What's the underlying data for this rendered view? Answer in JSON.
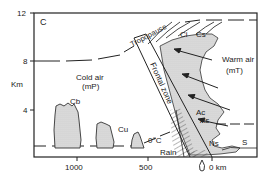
{
  "figure": {
    "panel_label": "C",
    "y_axis": {
      "label": "Km",
      "ticks": [
        "12",
        "8",
        "4"
      ]
    },
    "x_axis": {
      "ticks": [
        "1000",
        "500",
        "0 km"
      ]
    },
    "labels": {
      "tropopause": "Tropopause",
      "frontal_zone": "Frontal zone",
      "cold_air": "Cold air",
      "cold_air_mass": "(mP)",
      "warm_air": "Warm air",
      "warm_air_mass": "(mT)",
      "freezing_level": "0°C",
      "rain": "Rain"
    },
    "clouds": [
      "Ci",
      "Cs",
      "Ac",
      "As",
      "Ns",
      "S",
      "Cb",
      "Cu"
    ],
    "colors": {
      "line": "#222222",
      "cloud_fill": "#d9d9d9",
      "background": "#ffffff"
    }
  }
}
